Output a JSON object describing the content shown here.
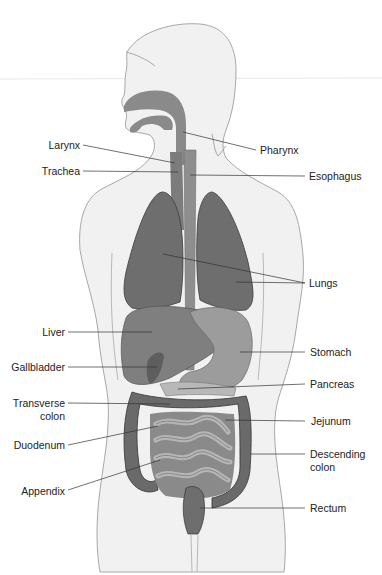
{
  "diagram": {
    "colors": {
      "background": "#ffffff",
      "body_fill": "#f1f1f1",
      "body_outline": "#a8a8a8",
      "airway": "#8a8a8a",
      "lungs": "#6e6e6e",
      "liver": "#7f7f7f",
      "stomach": "#9c9c9c",
      "intestine_light": "#a9a9a9",
      "intestine_dark": "#6a6a6a",
      "leader_line": "#333333",
      "label_text": "#222222"
    },
    "labels_left": [
      {
        "id": "larynx",
        "text": "Larynx"
      },
      {
        "id": "trachea",
        "text": "Trachea"
      },
      {
        "id": "liver",
        "text": "Liver"
      },
      {
        "id": "gallbladder",
        "text": "Gallbladder"
      },
      {
        "id": "transverse-colon",
        "line1": "Transverse",
        "line2": "colon"
      },
      {
        "id": "duodenum",
        "text": "Duodenum"
      },
      {
        "id": "appendix",
        "text": "Appendix"
      }
    ],
    "labels_right": [
      {
        "id": "pharynx",
        "text": "Pharynx"
      },
      {
        "id": "esophagus",
        "text": "Esophagus"
      },
      {
        "id": "lungs",
        "text": "Lungs"
      },
      {
        "id": "stomach",
        "text": "Stomach"
      },
      {
        "id": "pancreas",
        "text": "Pancreas"
      },
      {
        "id": "jejunum",
        "text": "Jejunum"
      },
      {
        "id": "descending-colon",
        "line1": "Descending",
        "line2": "colon"
      },
      {
        "id": "rectum",
        "text": "Rectum"
      }
    ]
  }
}
